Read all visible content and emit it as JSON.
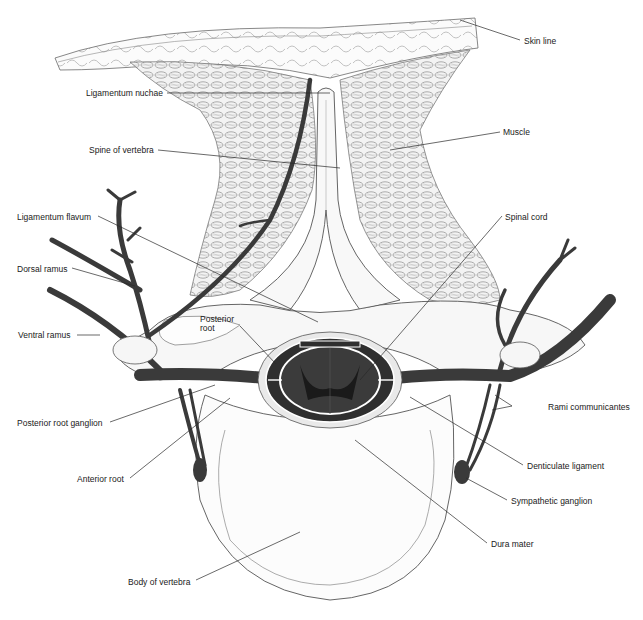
{
  "figure": {
    "type": "anatomical cross-section"
  },
  "colors": {
    "nerve": "#3a3a3a",
    "cord": "#2b2b2b",
    "outline": "#555555",
    "tissue_fill": "#f6f6f6",
    "background": "#ffffff",
    "label_text": "#1a1a1a"
  },
  "labels": {
    "skin_line": "Skin line",
    "ligamentum_nuchae": "Ligamentum nuchae",
    "muscle": "Muscle",
    "spine_of_vertebra": "Spine of vertebra",
    "ligamentum_flavum": "Ligamentum flavum",
    "spinal_cord": "Spinal cord",
    "dorsal_ramus": "Dorsal ramus",
    "ventral_ramus": "Ventral ramus",
    "posterior_root_l1": "Posterior",
    "posterior_root_l2": "root",
    "rami_communicantes": "Rami communicantes",
    "posterior_root_ganglion": "Posterior root ganglion",
    "denticulate_ligament": "Denticulate ligament",
    "anterior_root": "Anterior root",
    "sympathetic_ganglion": "Sympathetic ganglion",
    "dura_mater": "Dura mater",
    "body_of_vertebra": "Body of vertebra"
  }
}
